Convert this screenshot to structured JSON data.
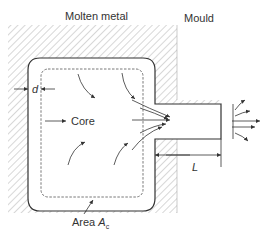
{
  "diagram": {
    "labels": {
      "molten_metal": "Molten metal",
      "mould": "Mould",
      "core": "Core",
      "thickness": "d",
      "length": "L",
      "area_prefix": "Area",
      "area_symbol": "A",
      "area_subscript": "c"
    },
    "colors": {
      "line": "#333333",
      "hatch": "#9a9a9a",
      "background": "#ffffff"
    }
  }
}
